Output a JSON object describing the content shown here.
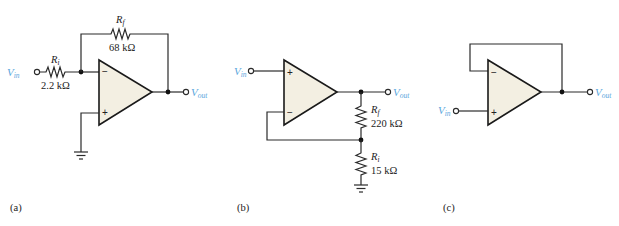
{
  "colors": {
    "signal_label": "#5aa6dc",
    "opamp_fill": "#f3efe2",
    "wire": "#2a2a2a"
  },
  "circuits": [
    {
      "caption": "(a)",
      "type": "inverting amplifier",
      "input_label": {
        "main": "V",
        "sub": "in"
      },
      "output_label": {
        "main": "V",
        "sub": "out"
      },
      "rf": {
        "name_main": "R",
        "name_sub": "f",
        "value": "68 kΩ"
      },
      "ri": {
        "name_main": "R",
        "name_sub": "i",
        "value": "2.2 kΩ"
      },
      "inputs": {
        "top": "−",
        "bottom": "+"
      }
    },
    {
      "caption": "(b)",
      "type": "noninverting amplifier",
      "input_label": {
        "main": "V",
        "sub": "in"
      },
      "output_label": {
        "main": "V",
        "sub": "out"
      },
      "rf": {
        "name_main": "R",
        "name_sub": "f",
        "value": "220 kΩ"
      },
      "ri": {
        "name_main": "R",
        "name_sub": "i",
        "value": "15 kΩ"
      },
      "inputs": {
        "top": "+",
        "bottom": "−"
      }
    },
    {
      "caption": "(c)",
      "type": "voltage follower",
      "input_label": {
        "main": "V",
        "sub": "in"
      },
      "output_label": {
        "main": "V",
        "sub": "out"
      },
      "inputs": {
        "top": "−",
        "bottom": "+"
      }
    }
  ]
}
